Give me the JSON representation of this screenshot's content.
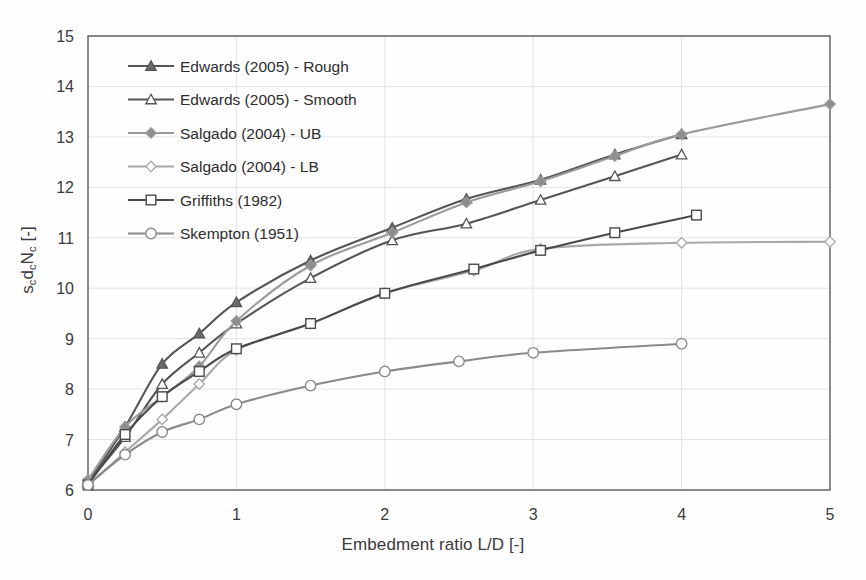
{
  "chart_data": {
    "type": "line",
    "title": "",
    "xlabel": "Embedment ratio L/D [-]",
    "ylabel_parts": {
      "s": "s",
      "sub1": "c",
      "d": "d",
      "sub2": "c",
      "n": "N",
      "sub3": "c",
      "unit": "[-]"
    },
    "ylabel": "scdcNc [-]",
    "xlim": [
      0,
      5
    ],
    "ylim": [
      6,
      15
    ],
    "xticks": [
      0,
      1,
      2,
      3,
      4,
      5
    ],
    "yticks": [
      6,
      7,
      8,
      9,
      10,
      11,
      12,
      13,
      14,
      15
    ],
    "grid": true,
    "legend_position": "top-left",
    "series": [
      {
        "name": "Edwards (2005) - Rough",
        "marker": "triangle-filled",
        "color": "#555555",
        "fill": "#6b6b6b",
        "x": [
          0,
          0.25,
          0.5,
          0.75,
          1.0,
          1.5,
          2.05,
          2.55,
          3.05,
          3.55,
          4.0
        ],
        "y": [
          6.15,
          7.25,
          8.5,
          9.1,
          9.72,
          10.55,
          11.2,
          11.77,
          12.15,
          12.65,
          13.05
        ]
      },
      {
        "name": "Edwards (2005) - Smooth",
        "marker": "triangle-open",
        "color": "#555555",
        "fill": "#ffffff",
        "x": [
          0,
          0.25,
          0.5,
          0.75,
          1.0,
          1.5,
          2.05,
          2.55,
          3.05,
          3.55,
          4.0
        ],
        "y": [
          6.15,
          7.05,
          8.1,
          8.72,
          9.3,
          10.2,
          10.95,
          11.28,
          11.75,
          12.22,
          12.65
        ]
      },
      {
        "name": "Salgado (2004) - UB",
        "marker": "diamond-filled",
        "color": "#9b9b9b",
        "fill": "#8d8d8d",
        "x": [
          0,
          0.25,
          0.5,
          0.75,
          1.0,
          1.5,
          2.05,
          2.55,
          3.05,
          3.55,
          4.0,
          5.0
        ],
        "y": [
          6.2,
          7.25,
          7.85,
          8.45,
          9.35,
          10.45,
          11.1,
          11.7,
          12.12,
          12.62,
          13.05,
          13.65
        ]
      },
      {
        "name": "Salgado (2004) - LB",
        "marker": "diamond-open",
        "color": "#a8a8a8",
        "fill": "#ffffff",
        "x": [
          0,
          0.25,
          0.5,
          0.75,
          1.0,
          1.5,
          2.0,
          2.6,
          3.05,
          4.0,
          5.0
        ],
        "y": [
          6.1,
          6.75,
          7.4,
          8.1,
          8.78,
          9.3,
          9.9,
          10.35,
          10.78,
          10.9,
          10.92
        ]
      },
      {
        "name": "Griffiths (1982)",
        "marker": "square-open",
        "color": "#4a4a4a",
        "fill": "#ffffff",
        "x": [
          0,
          0.25,
          0.5,
          0.75,
          1.0,
          1.5,
          2.0,
          2.6,
          3.05,
          3.55,
          4.1
        ],
        "y": [
          6.1,
          7.1,
          7.85,
          8.35,
          8.8,
          9.3,
          9.9,
          10.38,
          10.75,
          11.1,
          11.45
        ]
      },
      {
        "name": "Skempton (1951)",
        "marker": "circle-open",
        "color": "#8a8a8a",
        "fill": "#ffffff",
        "x": [
          0,
          0.25,
          0.5,
          0.75,
          1.0,
          1.5,
          2.0,
          2.5,
          3.0,
          4.0
        ],
        "y": [
          6.1,
          6.7,
          7.15,
          7.4,
          7.7,
          8.07,
          8.35,
          8.55,
          8.72,
          8.9
        ]
      }
    ]
  }
}
